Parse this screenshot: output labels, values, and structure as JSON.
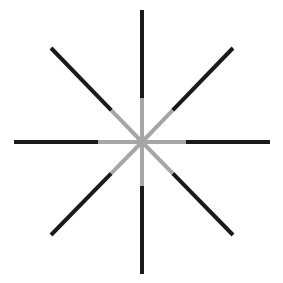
{
  "figure": {
    "center": [
      142,
      142
    ],
    "line_width": 4,
    "inner_radius": 44,
    "outer_color": "#1a1a1a",
    "inner_color": "#a6a6a6",
    "background": "#ffffff",
    "rays": [
      {
        "name": "up",
        "end": [
          142,
          10
        ]
      },
      {
        "name": "down",
        "end": [
          142,
          274
        ]
      },
      {
        "name": "left",
        "end": [
          14,
          142
        ]
      },
      {
        "name": "right",
        "end": [
          270,
          142
        ]
      },
      {
        "name": "up-left",
        "end": [
          51,
          48
        ]
      },
      {
        "name": "up-right",
        "end": [
          233,
          48
        ]
      },
      {
        "name": "down-left",
        "end": [
          51,
          235
        ]
      },
      {
        "name": "down-right",
        "end": [
          233,
          235
        ]
      }
    ]
  }
}
